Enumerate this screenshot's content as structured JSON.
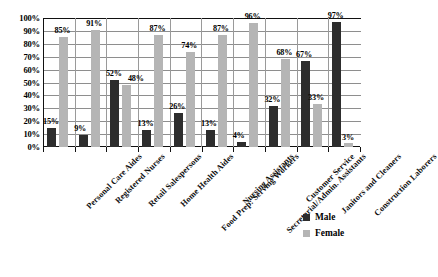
{
  "chart_data": {
    "type": "bar",
    "title": "Percentage of Male and Female Workers by Occupation",
    "xlabel": "",
    "ylabel": "",
    "ylim": [
      0,
      100
    ],
    "yticks": [
      "0%",
      "10%",
      "20%",
      "30%",
      "40%",
      "50%",
      "60%",
      "70%",
      "80%",
      "90%",
      "100%"
    ],
    "grid": true,
    "legend_position": "bottom-right",
    "categories": [
      "Personal Care Aides",
      "Registered Nurses",
      "Retail Salespersons",
      "Home Health Aides",
      "Food Prep: Serving Workers",
      "Nursing Assistants",
      "Secretarial/Admin. Assistants",
      "Customer Service",
      "Janitors and Cleaners",
      "Construction Laborers"
    ],
    "series": [
      {
        "name": "Male",
        "color": "#2d2d2d",
        "values": [
          15,
          9,
          52,
          13,
          26,
          13,
          4,
          32,
          67,
          97
        ],
        "labels": [
          "15%",
          "9%",
          "52%",
          "13%",
          "26%",
          "13%",
          "4%",
          "32%",
          "67%",
          "97%"
        ]
      },
      {
        "name": "Female",
        "color": "#b5b5b5",
        "values": [
          85,
          91,
          48,
          87,
          74,
          87,
          96,
          68,
          33,
          3
        ],
        "labels": [
          "85%",
          "91%",
          "48%",
          "87%",
          "74%",
          "87%",
          "96%",
          "68%",
          "33%",
          "3%"
        ]
      }
    ]
  },
  "legend": {
    "items": [
      {
        "label": "Male",
        "color": "#2d2d2d"
      },
      {
        "label": "Female",
        "color": "#b5b5b5"
      }
    ]
  }
}
